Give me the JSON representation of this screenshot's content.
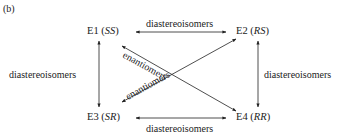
{
  "panel_label": "(b)",
  "nodes": {
    "e1": {
      "name": "E1",
      "config": "SS"
    },
    "e2": {
      "name": "E2",
      "config": "RS"
    },
    "e3": {
      "name": "E3",
      "config": "SR"
    },
    "e4": {
      "name": "E4",
      "config": "RR"
    }
  },
  "edges": {
    "top": "diastereoisomers",
    "bottom": "diastereoisomers",
    "left": "diastereoisomers",
    "right": "diastereoisomers",
    "diag1": "enantiomers",
    "diag2": "enantiomers"
  }
}
